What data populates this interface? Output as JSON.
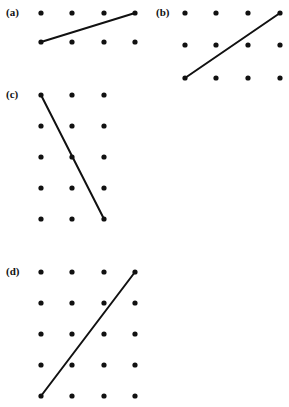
{
  "figure": {
    "title": "",
    "width": 289,
    "height": 407,
    "background_color": "#ffffff",
    "ink_color": "#111111",
    "dot_radius": 2.6,
    "line_width": 2.0
  },
  "panels": [
    {
      "id": "a",
      "label": "(a)",
      "label_x": 6,
      "label_y": 16,
      "rows": 2,
      "cols": 4,
      "col_x": [
        41,
        72,
        104,
        135
      ],
      "row_y": [
        13,
        42
      ],
      "line": {
        "x1": 41,
        "y1": 42,
        "x2": 135,
        "y2": 13,
        "from_dot": "row2-col1",
        "to_dot": "row1-col4"
      }
    },
    {
      "id": "b",
      "label": "(b)",
      "label_x": 156,
      "label_y": 16,
      "rows": 3,
      "cols": 4,
      "col_x": [
        185,
        216,
        248,
        280
      ],
      "row_y": [
        13,
        45,
        78
      ],
      "line": {
        "x1": 185,
        "y1": 78,
        "x2": 280,
        "y2": 13,
        "from_dot": "row3-col1",
        "to_dot": "row1-col4"
      }
    },
    {
      "id": "c",
      "label": "(c)",
      "label_x": 6,
      "label_y": 98,
      "rows": 5,
      "cols": 3,
      "col_x": [
        41,
        72,
        104
      ],
      "row_y": [
        95,
        126,
        157,
        188,
        219
      ],
      "line": {
        "x1": 41,
        "y1": 95,
        "x2": 104,
        "y2": 219,
        "from_dot": "row1-col1",
        "to_dot": "row5-col3"
      }
    },
    {
      "id": "d",
      "label": "(d)",
      "label_x": 6,
      "label_y": 275,
      "rows": 5,
      "cols": 4,
      "col_x": [
        41,
        72,
        104,
        135
      ],
      "row_y": [
        272,
        303,
        334,
        365,
        396
      ],
      "line": {
        "x1": 41,
        "y1": 396,
        "x2": 135,
        "y2": 272,
        "from_dot": "row5-col1",
        "to_dot": "row1-col4"
      }
    }
  ]
}
